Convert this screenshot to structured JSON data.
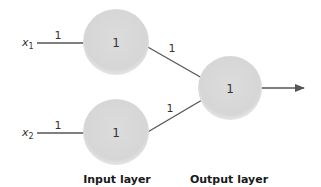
{
  "diagram": {
    "type": "neural-network",
    "colors": {
      "node_fill": "#d9d9d9",
      "edge": "#555555",
      "text": "#333333"
    },
    "inputs": [
      {
        "symbol": "x",
        "subscript": "1",
        "weight": "1"
      },
      {
        "symbol": "x",
        "subscript": "2",
        "weight": "1"
      }
    ],
    "input_nodes": [
      {
        "label": "1",
        "weight_to_output": "1"
      },
      {
        "label": "1",
        "weight_to_output": "1"
      }
    ],
    "output_node": {
      "label": "1"
    },
    "layers": {
      "input": "Input layer",
      "output": "Output layer"
    }
  }
}
